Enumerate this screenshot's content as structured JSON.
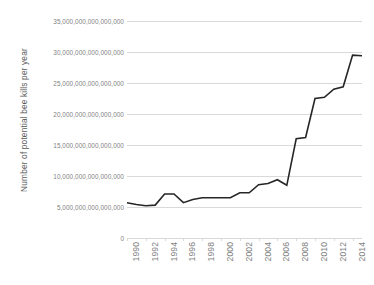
{
  "chart_data": {
    "type": "line",
    "title": "",
    "xlabel": "",
    "ylabel": "Number of potential bee kills per year",
    "xlim": [
      1990,
      2015
    ],
    "ylim": [
      0,
      35000000000000000
    ],
    "grid": true,
    "legend": false,
    "legend_position": "none",
    "line_color": "#262626",
    "gridline_color": "#d9d9d9",
    "tick_label_color": "#7f7f7f",
    "axis_title_color": "#595959",
    "background_color": "#ffffff",
    "y_ticks": [
      0,
      5000000000000000,
      10000000000000000,
      15000000000000000,
      20000000000000000,
      25000000000000000,
      30000000000000000,
      35000000000000000
    ],
    "y_tick_labels": [
      "0",
      "5,000,000,000,000,000",
      "10,000,000,000,000,000",
      "15,000,000,000,000,000",
      "20,000,000,000,000,000",
      "25,000,000,000,000,000",
      "30,000,000,000,000,000",
      "35,000,000,000,000,000"
    ],
    "x_ticks": [
      1990,
      1992,
      1994,
      1996,
      1998,
      2000,
      2002,
      2004,
      2006,
      2008,
      2010,
      2012,
      2014
    ],
    "x_tick_labels": [
      "1990",
      "1992",
      "1994",
      "1996",
      "1998",
      "2000",
      "2002",
      "2004",
      "2006",
      "2008",
      "2010",
      "2012",
      "2014"
    ],
    "x": [
      1990,
      1991,
      1992,
      1993,
      1994,
      1995,
      1996,
      1997,
      1998,
      1999,
      2000,
      2001,
      2002,
      2003,
      2004,
      2005,
      2006,
      2007,
      2008,
      2009,
      2010,
      2011,
      2012,
      2013,
      2014,
      2015
    ],
    "series": [
      {
        "name": "Number of potential bee kills per year",
        "values": [
          5700000000000000,
          5400000000000000,
          5200000000000000,
          5300000000000000,
          7100000000000000,
          7100000000000000,
          5700000000000000,
          6200000000000000,
          6500000000000000,
          6500000000000000,
          6500000000000000,
          6500000000000000,
          7300000000000000,
          7300000000000000,
          8600000000000000,
          8800000000000000,
          9400000000000000,
          8500000000000000,
          16000000000000000,
          16200000000000000,
          22500000000000000,
          22700000000000000,
          24000000000000000,
          24400000000000000,
          29500000000000000,
          29400000000000000
        ]
      }
    ]
  }
}
